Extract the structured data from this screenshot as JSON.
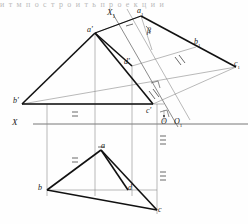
{
  "figure": {
    "kind": "descriptive-geometry-orthographic-projection",
    "title_strip": "и т  м  п о с т р о и т ь  п р о е к ц и и",
    "ground_line_label": "X",
    "aux_axis_label": "X",
    "aux_axis_sub": "1",
    "angle_label": "β",
    "origin_label": "O",
    "origin_aux_label": "O",
    "origin_aux_sub": "1"
  },
  "labels": {
    "a_front": "a'",
    "d_front": "d'",
    "b_front": "b'",
    "c_front": "c'",
    "a_aux": "a",
    "a_aux_sub": "1",
    "b_aux": "b",
    "b_aux_sub": "1",
    "c_aux": "c",
    "c_aux_sub": "1",
    "a_plan": "a",
    "b_plan": "b",
    "c_plan": "c",
    "d_plan": "d"
  },
  "colors": {
    "ink": "#1a1a1a",
    "thin": "#7d7d7d",
    "paper": "#fefefe",
    "faint": "#b9b9b9"
  },
  "geometry": {
    "ground_line_y": 124,
    "ground_line_x_start": 33,
    "ground_line_x_end": 248,
    "points": {
      "a_front": [
        95,
        33
      ],
      "d_front": [
        132,
        66
      ],
      "b_front": [
        22,
        104
      ],
      "c_front": [
        153,
        104
      ],
      "a_aux": [
        141,
        16
      ],
      "b_aux": [
        196,
        47
      ],
      "c_aux": [
        236,
        67
      ],
      "a_plan": [
        101,
        150
      ],
      "b_plan": [
        47,
        190
      ],
      "c_plan": [
        157,
        210
      ],
      "d_plan": [
        128,
        190
      ],
      "origin": [
        164,
        116
      ],
      "origin_aux": [
        180,
        118
      ]
    },
    "tick_marks": [
      {
        "x": 178,
        "y": 61,
        "count": 2,
        "angle": -28
      },
      {
        "x": 152,
        "y": 95,
        "count": 2,
        "angle": -28
      },
      {
        "x": 75,
        "y": 116,
        "count": 2,
        "angle": 0
      },
      {
        "x": 75,
        "y": 160,
        "count": 2,
        "angle": 0
      },
      {
        "x": 163,
        "y": 140,
        "count": 3,
        "angle": 0
      },
      {
        "x": 163,
        "y": 178,
        "count": 3,
        "angle": 0
      }
    ]
  }
}
